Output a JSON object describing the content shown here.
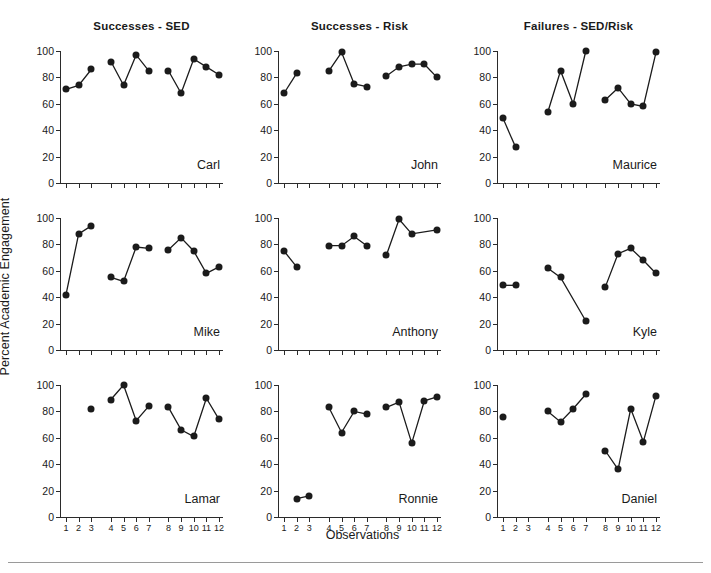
{
  "figure": {
    "ylabel": "Percent Academic Engagement",
    "xlabel": "Observations",
    "column_titles": [
      "Successes - SED",
      "Successes - Risk",
      "Failures - SED/Risk"
    ],
    "ytick_labels": [
      "0",
      "20",
      "40",
      "60",
      "80",
      "100"
    ],
    "xtick_labels": [
      "1",
      "2",
      "3",
      "4",
      "5",
      "6",
      "7",
      "8",
      "9",
      "10",
      "11",
      "12"
    ],
    "dot_color": "#1b1b1b",
    "axis_color": "#2b2b2b"
  },
  "chart_data": {
    "type": "line",
    "xlabel": "Observations",
    "ylabel": "Percent Academic Engagement",
    "xlim": [
      0.4,
      12.6
    ],
    "ylim": [
      0,
      100
    ],
    "yticks": [
      0,
      20,
      40,
      60,
      80,
      100
    ],
    "xticks": [
      1,
      2,
      3,
      4,
      5,
      6,
      7,
      8,
      9,
      10,
      11,
      12
    ],
    "grid": false,
    "legend": false,
    "phase_breaks": [
      3.5,
      7.5
    ],
    "columns": [
      {
        "title": "Successes - SED",
        "panels": [
          {
            "name": "Carl",
            "segments": [
              {
                "x": [
                  1,
                  2,
                  3
                ],
                "y": [
                  71,
                  74,
                  86
                ]
              },
              {
                "x": [
                  4,
                  5,
                  6,
                  7
                ],
                "y": [
                  92,
                  74,
                  97,
                  85
                ]
              },
              {
                "x": [
                  8,
                  9,
                  10,
                  11,
                  12
                ],
                "y": [
                  85,
                  68,
                  94,
                  88,
                  82
                ]
              }
            ]
          },
          {
            "name": "Mike",
            "segments": [
              {
                "x": [
                  1,
                  2,
                  3
                ],
                "y": [
                  42,
                  88,
                  94
                ]
              },
              {
                "x": [
                  4,
                  5,
                  6,
                  7
                ],
                "y": [
                  55,
                  52,
                  78,
                  77
                ]
              },
              {
                "x": [
                  8,
                  9,
                  10,
                  11,
                  12
                ],
                "y": [
                  76,
                  85,
                  75,
                  58,
                  63
                ]
              }
            ]
          },
          {
            "name": "Lamar",
            "segments": [
              {
                "x": [
                  3
                ],
                "y": [
                  82
                ]
              },
              {
                "x": [
                  4,
                  5,
                  6,
                  7
                ],
                "y": [
                  89,
                  100,
                  73,
                  84
                ]
              },
              {
                "x": [
                  8,
                  9,
                  10,
                  11,
                  12
                ],
                "y": [
                  83,
                  66,
                  61,
                  90,
                  74
                ]
              }
            ]
          }
        ]
      },
      {
        "title": "Successes - Risk",
        "panels": [
          {
            "name": "John",
            "segments": [
              {
                "x": [
                  1,
                  2
                ],
                "y": [
                  68,
                  83
                ]
              },
              {
                "x": [
                  4,
                  5,
                  6,
                  7
                ],
                "y": [
                  85,
                  99,
                  75,
                  73
                ]
              },
              {
                "x": [
                  8,
                  9,
                  10,
                  11,
                  12
                ],
                "y": [
                  81,
                  88,
                  90,
                  90,
                  80
                ]
              }
            ]
          },
          {
            "name": "Anthony",
            "segments": [
              {
                "x": [
                  1,
                  2
                ],
                "y": [
                  75,
                  63
                ]
              },
              {
                "x": [
                  4,
                  5,
                  6,
                  7
                ],
                "y": [
                  79,
                  79,
                  86,
                  79
                ]
              },
              {
                "x": [
                  8,
                  9,
                  10,
                  12
                ],
                "y": [
                  72,
                  99,
                  88,
                  91
                ]
              }
            ]
          },
          {
            "name": "Ronnie",
            "segments": [
              {
                "x": [
                  2,
                  3
                ],
                "y": [
                  14,
                  16
                ]
              },
              {
                "x": [
                  4,
                  5,
                  6,
                  7
                ],
                "y": [
                  83,
                  64,
                  80,
                  78
                ]
              },
              {
                "x": [
                  8,
                  9,
                  10,
                  11,
                  12
                ],
                "y": [
                  83,
                  87,
                  56,
                  88,
                  91
                ]
              }
            ]
          }
        ]
      },
      {
        "title": "Failures - SED/Risk",
        "panels": [
          {
            "name": "Maurice",
            "segments": [
              {
                "x": [
                  1,
                  2
                ],
                "y": [
                  49,
                  27
                ]
              },
              {
                "x": [
                  4,
                  5,
                  6,
                  7
                ],
                "y": [
                  54,
                  85,
                  60,
                  100
                ]
              },
              {
                "x": [
                  8,
                  9,
                  10,
                  11,
                  12
                ],
                "y": [
                  63,
                  72,
                  60,
                  58,
                  99
                ]
              }
            ]
          },
          {
            "name": "Kyle",
            "segments": [
              {
                "x": [
                  1,
                  2
                ],
                "y": [
                  49,
                  49
                ]
              },
              {
                "x": [
                  4,
                  5,
                  7
                ],
                "y": [
                  62,
                  55,
                  22
                ]
              },
              {
                "x": [
                  8,
                  9,
                  10,
                  11,
                  12
                ],
                "y": [
                  48,
                  73,
                  77,
                  68,
                  58
                ]
              }
            ]
          },
          {
            "name": "Daniel",
            "segments": [
              {
                "x": [
                  1
                ],
                "y": [
                  76
                ]
              },
              {
                "x": [
                  4,
                  5,
                  6,
                  7
                ],
                "y": [
                  80,
                  72,
                  82,
                  93
                ]
              },
              {
                "x": [
                  8,
                  9,
                  10,
                  11,
                  12
                ],
                "y": [
                  50,
                  36,
                  82,
                  57,
                  92
                ]
              }
            ]
          }
        ]
      }
    ]
  }
}
